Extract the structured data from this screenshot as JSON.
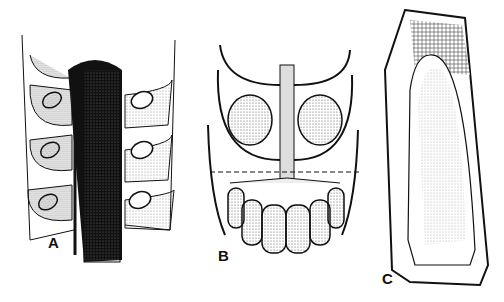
{
  "figure": {
    "panels": [
      {
        "id": "A",
        "label": "A",
        "description": "Longitudinal section of strobilus axis with sporangia and sporangiophore bracts"
      },
      {
        "id": "B",
        "label": "B",
        "description": "Face view of sporangiophore unit with two sporangia above dashed line and radiating segments below"
      },
      {
        "id": "C",
        "label": "C",
        "description": "Sporangium cross-section with cellular wall and stippled interior"
      }
    ],
    "colors": {
      "ink": "#111111",
      "stipple": "#9a9a9a",
      "background": "#ffffff"
    }
  }
}
